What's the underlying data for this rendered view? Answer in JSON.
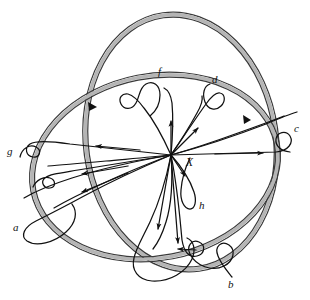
{
  "figure": {
    "kind": "topological-diagram",
    "width": 310,
    "height": 300,
    "background_color": "#ffffff",
    "stroke_color": "#111111",
    "tube_fill_color": "#b5b5b5",
    "tube_edge_color": "#3a3a3a"
  },
  "center": {
    "label": "X",
    "x": 171,
    "y": 155,
    "label_x": 186,
    "label_y": 166
  },
  "tubes": [
    {
      "name": "upper-right-circle",
      "cx": 181,
      "cy": 142,
      "rx": 95,
      "ry": 128,
      "rotation": -8,
      "band_width": 5
    },
    {
      "name": "lower-left-ellipse",
      "cx": 155,
      "cy": 167,
      "rx": 124,
      "ry": 91,
      "rotation": -11,
      "band_width": 5
    }
  ],
  "curves": [
    {
      "label": "a",
      "label_x": 13,
      "label_y": 231,
      "arrow_dir": "away-from-center"
    },
    {
      "label": "b",
      "label_x": 228,
      "label_y": 288,
      "arrow_dir": "toward-center"
    },
    {
      "label": "c",
      "label_x": 294,
      "label_y": 132,
      "arrow_dir": "away-from-center"
    },
    {
      "label": "d",
      "label_x": 212,
      "label_y": 83,
      "arrow_dir": "toward-center"
    },
    {
      "label": "f",
      "label_x": 158,
      "label_y": 75,
      "arrow_dir": "toward-center"
    },
    {
      "label": "g",
      "label_x": 7,
      "label_y": 155,
      "arrow_dir": "away-from-center"
    },
    {
      "label": "h",
      "label_x": 199,
      "label_y": 209,
      "arrow_dir": "toward-center"
    }
  ],
  "tube_markers": [
    {
      "name": "tube-marker-left",
      "x": 92,
      "y": 106
    },
    {
      "name": "tube-marker-right",
      "x": 247,
      "y": 119
    }
  ]
}
